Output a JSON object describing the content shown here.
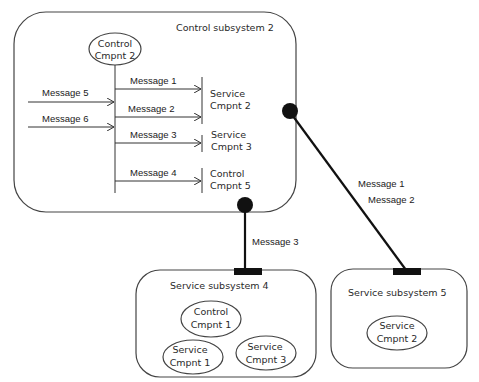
{
  "diagram": {
    "control_subsystem": {
      "label": "Control subsystem 2",
      "component": {
        "line1": "Control",
        "line2": "Cmpnt 2"
      },
      "incoming_messages": [
        "Message 5",
        "Message 6"
      ],
      "outgoing_messages": [
        "Message 1",
        "Message 2",
        "Message 3",
        "Message 4"
      ],
      "targets": [
        {
          "line1": "Service",
          "line2": "Cmpnt 2"
        },
        {
          "line1": "Service",
          "line2": "Cmpnt 3"
        },
        {
          "line1": "Control",
          "line2": "Cmpnt 5"
        }
      ]
    },
    "connector_to_subsystem5": {
      "labels": [
        "Message 1",
        "Message 2"
      ]
    },
    "connector_to_subsystem4": {
      "labels": [
        "Message 3"
      ]
    },
    "service_subsystem_4": {
      "label": "Service subsystem 4",
      "components": [
        {
          "line1": "Control",
          "line2": "Cmpnt 1"
        },
        {
          "line1": "Service",
          "line2": "Cmpnt 1"
        },
        {
          "line1": "Service",
          "line2": "Cmpnt 3"
        }
      ]
    },
    "service_subsystem_5": {
      "label": "Service subsystem 5",
      "components": [
        {
          "line1": "Service",
          "line2": "Cmpnt 2"
        }
      ]
    }
  }
}
